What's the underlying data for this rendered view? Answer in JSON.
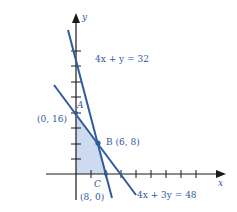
{
  "diagram": {
    "axes": {
      "x_label": "x",
      "y_label": "y"
    },
    "lines": [
      {
        "name": "4x + y = 32",
        "label": "4x + y = 32",
        "intercepts": {
          "x": 8,
          "y": 32
        }
      },
      {
        "name": "4x + 3y = 48",
        "label": "4x + 3y = 48",
        "intercepts": {
          "x": 12,
          "y": 16
        }
      }
    ],
    "points": [
      {
        "name": "A",
        "coords": "(0, 16)"
      },
      {
        "name": "B",
        "coords": "(6, 8)",
        "label": "B (6, 8)"
      },
      {
        "name": "C",
        "coords": "(8, 0)"
      }
    ],
    "feasible_region": {
      "vertices": [
        "(0,0)",
        "(0,16)",
        "(6,8)",
        "(8,0)"
      ],
      "color": "#c5d3ec"
    },
    "colors": {
      "line": "#2f5aa0",
      "axis": "#1a1a1a",
      "text": "#2f5aa0"
    }
  }
}
